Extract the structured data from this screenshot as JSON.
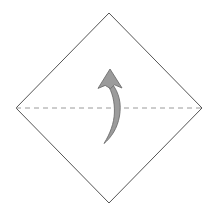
{
  "canvas": {
    "width": 219,
    "height": 214,
    "background": "#ffffff",
    "title": "Origami fold diagram",
    "description": "Square paper rotated 45 degrees with a horizontal dashed fold line and a curved upward arrow indicating a valley fold upward"
  },
  "figure": {
    "shape_name": "diamond-square-sheet",
    "stroke_color": "#555555",
    "stroke_width": 1,
    "fill": "none",
    "vertices": [
      {
        "name": "top",
        "x": 109,
        "y": 13
      },
      {
        "name": "right",
        "x": 202,
        "y": 108
      },
      {
        "name": "bottom",
        "x": 109,
        "y": 203
      },
      {
        "name": "left",
        "x": 16,
        "y": 108
      }
    ]
  },
  "fold_line": {
    "name": "horizontal-fold-crease",
    "style": "dashed",
    "color": "#9a9a9a",
    "stroke_width": 1,
    "dash_pattern": "5,4",
    "x1": 16,
    "y1": 108,
    "x2": 202,
    "y2": 108
  },
  "arrow": {
    "name": "fold-direction-arrow",
    "direction": "up",
    "curved": true,
    "fill_color": "#9b9b9b",
    "stroke_color": "#6e6e6e",
    "stroke_width": 1,
    "head": {
      "tip_x": 110,
      "tip_y": 69,
      "left_x": 98,
      "right_x": 122,
      "base_y": 88
    },
    "tail": {
      "start_x": 110,
      "start_y": 86,
      "bulge_x": 120,
      "bulge_y": 108,
      "end_x": 104,
      "end_y": 143
    }
  },
  "labels": {
    "step_caption": ""
  }
}
